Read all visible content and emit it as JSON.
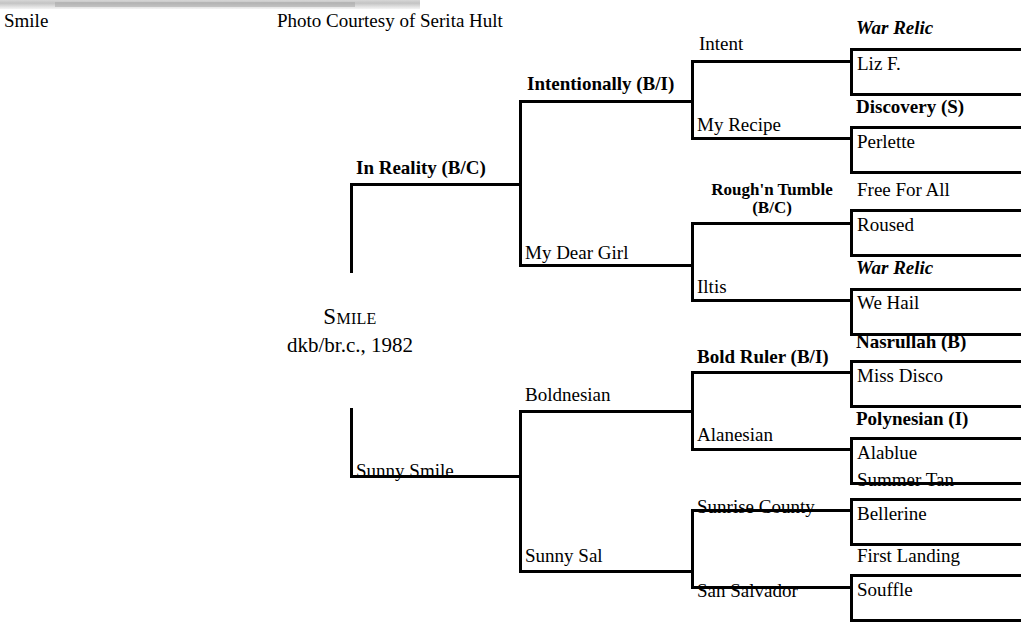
{
  "page": {
    "top_left_caption": "Smile",
    "photo_credit": "Photo Courtesy of Serita Hult"
  },
  "subject": {
    "name": "Smile",
    "details": "dkb/br.c., 1982"
  },
  "pedigree": {
    "gen1": [
      {
        "name": "In Reality (B/C)",
        "style": "bold"
      },
      {
        "name": "Sunny Smile",
        "style": "regular"
      }
    ],
    "gen2": [
      {
        "name": "Intentionally (B/I)",
        "style": "bold"
      },
      {
        "name": "My Dear Girl",
        "style": "regular"
      },
      {
        "name": "Boldnesian",
        "style": "regular"
      },
      {
        "name": "Sunny Sal",
        "style": "regular"
      }
    ],
    "gen3": [
      {
        "name": "Intent",
        "style": "regular"
      },
      {
        "name": "My Recipe",
        "style": "regular"
      },
      {
        "name": "Rough'n Tumble (B/C)",
        "line1": "Rough'n Tumble",
        "line2": "(B/C)",
        "style": "bold"
      },
      {
        "name": "Iltis",
        "style": "regular"
      },
      {
        "name": "Bold Ruler (B/I)",
        "style": "bold"
      },
      {
        "name": "Alanesian",
        "style": "regular"
      },
      {
        "name": "Sunrise County",
        "style": "regular"
      },
      {
        "name": "San Salvador",
        "style": "regular"
      }
    ],
    "gen4": [
      {
        "name": "War Relic",
        "style": "bold-italic"
      },
      {
        "name": "Liz F.",
        "style": "regular"
      },
      {
        "name": "Discovery (S)",
        "style": "bold"
      },
      {
        "name": "Perlette",
        "style": "regular"
      },
      {
        "name": "Free For All",
        "style": "regular"
      },
      {
        "name": "Roused",
        "style": "regular"
      },
      {
        "name": "War Relic",
        "style": "bold-italic"
      },
      {
        "name": "We Hail",
        "style": "regular"
      },
      {
        "name": "Nasrullah (B)",
        "style": "bold"
      },
      {
        "name": "Miss Disco",
        "style": "regular"
      },
      {
        "name": "Polynesian (I)",
        "style": "bold"
      },
      {
        "name": "Alablue",
        "style": "regular"
      },
      {
        "name": "Summer Tan",
        "style": "regular"
      },
      {
        "name": "Bellerine",
        "style": "regular"
      },
      {
        "name": "First Landing",
        "style": "regular"
      },
      {
        "name": "Souffle",
        "style": "regular"
      }
    ]
  },
  "colors": {
    "line": "#000000",
    "text": "#000000",
    "background": "#ffffff"
  }
}
